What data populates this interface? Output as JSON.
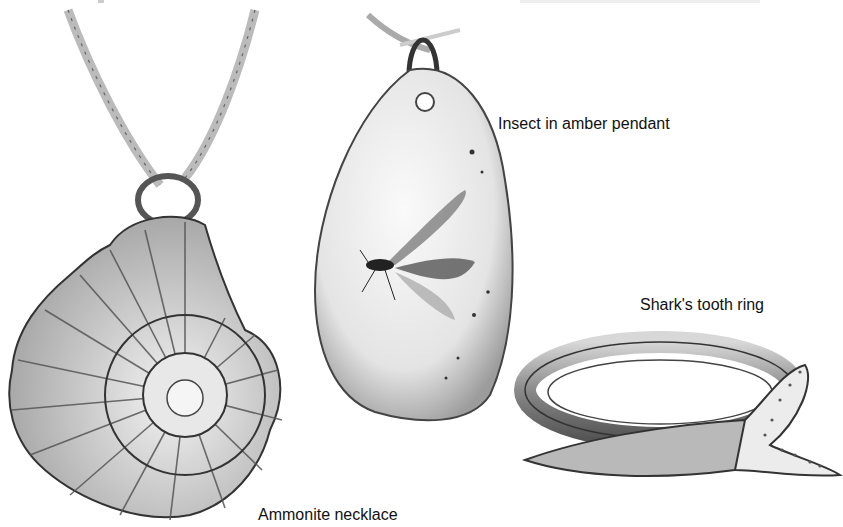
{
  "labels": {
    "amber": "Insect in amber pendant",
    "shark": "Shark's tooth ring",
    "ammonite": "Ammonite necklace"
  },
  "items": [
    {
      "name": "Ammonite necklace",
      "position": "left"
    },
    {
      "name": "Insect in amber pendant",
      "position": "center"
    },
    {
      "name": "Shark's tooth ring",
      "position": "right"
    }
  ],
  "colors": {
    "background": "#ffffff",
    "ink": "#222222",
    "shade": "#9a9a9a",
    "light": "#e6e6e6"
  }
}
